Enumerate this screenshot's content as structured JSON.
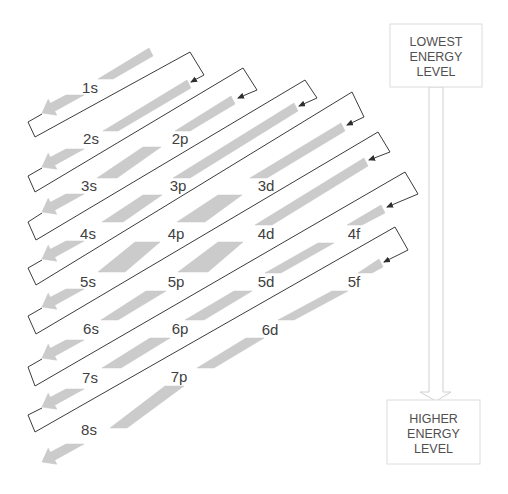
{
  "diagram": {
    "rows": [
      {
        "labels": [
          "1s"
        ]
      },
      {
        "labels": [
          "2s",
          "2p"
        ]
      },
      {
        "labels": [
          "3s",
          "3p",
          "3d"
        ]
      },
      {
        "labels": [
          "4s",
          "4p",
          "4d",
          "4f"
        ]
      },
      {
        "labels": [
          "5s",
          "5p",
          "5d",
          "5f"
        ]
      },
      {
        "labels": [
          "6s",
          "6p",
          "6d"
        ]
      },
      {
        "labels": [
          "7s",
          "7p"
        ]
      },
      {
        "labels": [
          "8s"
        ]
      }
    ],
    "diagonals": [
      [
        "1s"
      ],
      [
        "2s"
      ],
      [
        "2p",
        "3s"
      ],
      [
        "3p",
        "4s"
      ],
      [
        "3d",
        "4p",
        "5s"
      ],
      [
        "4d",
        "5p",
        "6s"
      ],
      [
        "4f",
        "5d",
        "6p",
        "7s"
      ],
      [
        "5f",
        "6d",
        "7p",
        "8s"
      ]
    ],
    "filling_order": [
      "1s",
      "2s",
      "2p",
      "3s",
      "3p",
      "4s",
      "3d",
      "4p",
      "5s",
      "4d",
      "5p",
      "6s",
      "4f",
      "5d",
      "6p",
      "7s",
      "5f",
      "6d",
      "7p",
      "8s"
    ],
    "energy_scale": {
      "top_box": {
        "lines": [
          "LOWEST",
          "ENERGY",
          "LEVEL"
        ]
      },
      "bottom_box": {
        "lines": [
          "HIGHER",
          "ENERGY",
          "LEVEL"
        ]
      },
      "arrow_direction": "down"
    },
    "colors": {
      "arrow_bar": "#cbcbcb",
      "connector": "#3c3c3c",
      "label_text": "#404040",
      "box_border": "#dcdcdc"
    }
  }
}
